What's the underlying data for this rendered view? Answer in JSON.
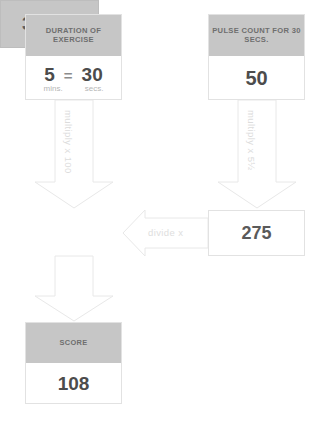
{
  "diagram": {
    "colors": {
      "header_fill": "#c6c6c6",
      "header_text": "#6e6e6e",
      "value_text": "#4c4c4c",
      "arrow_fill": "#ffffff",
      "arrow_stroke": "#e8e8e8",
      "arrow_label_text": "#dcdcdc",
      "background": "#ffffff"
    },
    "nodes": {
      "duration": {
        "header": "DURATION OF EXERCISE",
        "minutes_value": "5",
        "equals_sign": "=",
        "seconds_value": "30",
        "minutes_unit": "mins.",
        "seconds_unit": "secs."
      },
      "pulse": {
        "header": "PULSE COUNT FOR 30 SECS.",
        "value": "50"
      },
      "total": {
        "value": "30,000"
      },
      "pulse_total": {
        "value": "275"
      },
      "score": {
        "header": "SCORE",
        "value": "108"
      }
    },
    "arrows": {
      "duration_to_total": "multiply x 100",
      "pulse_to_pulse_total": "multiply x 5½",
      "pulse_total_to_total": "divide  x",
      "total_to_score": ""
    }
  }
}
